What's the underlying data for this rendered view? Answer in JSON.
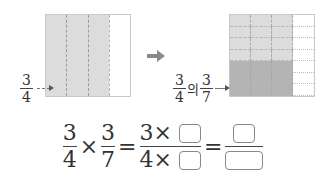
{
  "left_model": {
    "columns": 4,
    "shaded_columns": 3,
    "label": {
      "numerator": "3",
      "denominator": "4"
    }
  },
  "transition_arrow_icon": "right-arrow",
  "right_model": {
    "columns": 4,
    "rows": 7,
    "shaded_columns": 3,
    "dark_rows": 3,
    "label": {
      "first": {
        "numerator": "3",
        "denominator": "4"
      },
      "connector": "의",
      "second": {
        "numerator": "3",
        "denominator": "7"
      }
    }
  },
  "equation": {
    "term1": {
      "numerator": "3",
      "denominator": "4"
    },
    "times": "×",
    "term2": {
      "numerator": "3",
      "denominator": "7"
    },
    "equals": "=",
    "term3": {
      "numerator_prefix": "3×",
      "denominator_prefix": "4×"
    },
    "equals2": "="
  },
  "colors": {
    "light_shade": "#dcdcdc",
    "dark_shade": "#b4b4b4",
    "arrow": "#8a8a8a"
  }
}
